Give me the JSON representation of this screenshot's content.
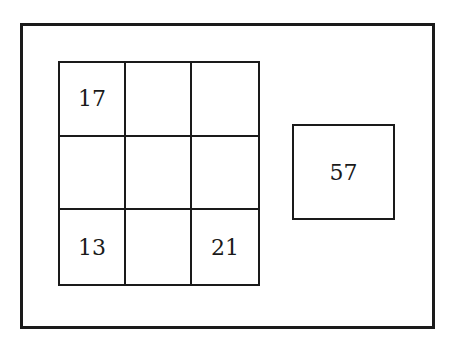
{
  "diagram": {
    "grid": {
      "rows": 3,
      "cols": 3,
      "cells": [
        [
          "17",
          "",
          ""
        ],
        [
          "",
          "",
          ""
        ],
        [
          "13",
          "",
          "21"
        ]
      ]
    },
    "target_box": {
      "value": "57"
    }
  }
}
